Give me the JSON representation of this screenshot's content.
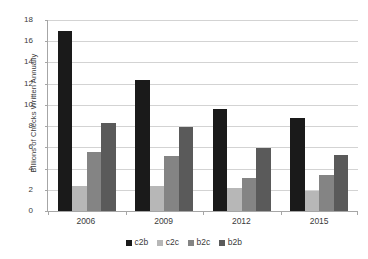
{
  "chart_data": {
    "type": "bar",
    "title": "",
    "subtitle": "",
    "xlabel": "",
    "ylabel": "Billions of Checks Written Annually",
    "categories": [
      "2006",
      "2009",
      "2012",
      "2015"
    ],
    "ylim": [
      0,
      18
    ],
    "yticks": [
      0,
      2,
      4,
      6,
      8,
      10,
      12,
      14,
      16,
      18
    ],
    "ytick_labels": [
      "0",
      "2",
      "4",
      "6",
      "8",
      "10",
      "12",
      "14",
      "16",
      "18"
    ],
    "grid": "horizontal",
    "legend_position": "bottom",
    "series": [
      {
        "name": "c2b",
        "color": "#1a1a1a",
        "values": [
          17.0,
          12.3,
          9.6,
          8.8
        ]
      },
      {
        "name": "c2c",
        "color": "#b7b7b7",
        "values": [
          2.4,
          2.4,
          2.2,
          1.9
        ]
      },
      {
        "name": "b2c",
        "color": "#848484",
        "values": [
          5.6,
          5.2,
          3.1,
          3.4
        ]
      },
      {
        "name": "b2b",
        "color": "#5a5a5a",
        "values": [
          8.3,
          7.9,
          5.9,
          5.3
        ]
      }
    ],
    "annotations": []
  },
  "legend": {
    "items": [
      {
        "label": "c2b",
        "color": "#1a1a1a"
      },
      {
        "label": "c2c",
        "color": "#b7b7b7"
      },
      {
        "label": "b2c",
        "color": "#848484"
      },
      {
        "label": "b2b",
        "color": "#5a5a5a"
      }
    ]
  },
  "colors": {
    "background": "#ffffff",
    "gridline": "#d3d3d3",
    "axis": "#a6a6a6",
    "text": "#3b3b3b"
  }
}
